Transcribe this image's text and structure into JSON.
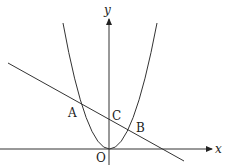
{
  "diagram": {
    "type": "coordinate-graph",
    "axes": {
      "x_label": "x",
      "y_label": "y",
      "origin_label": "O"
    },
    "curves": [
      {
        "name": "parabola",
        "description": "upward parabola with vertex at origin O"
      },
      {
        "name": "line",
        "description": "decreasing straight line intersecting parabola at A and B, y-axis at C"
      }
    ],
    "points": [
      {
        "label": "A",
        "description": "left intersection of line and parabola"
      },
      {
        "label": "B",
        "description": "right intersection of line and parabola"
      },
      {
        "label": "C",
        "description": "y-intercept of line"
      },
      {
        "label": "O",
        "description": "origin"
      }
    ],
    "colors": {
      "stroke": "#333333",
      "background": "#ffffff"
    }
  }
}
